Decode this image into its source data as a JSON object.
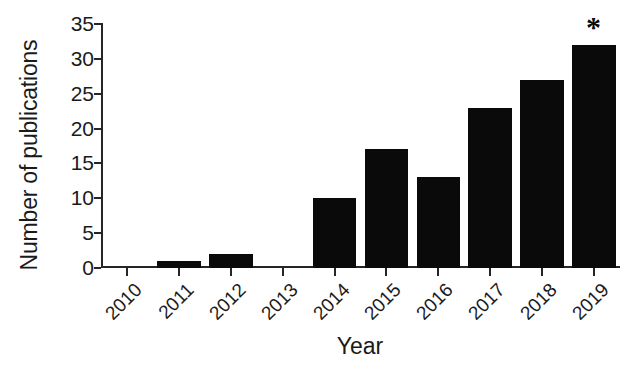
{
  "chart_data": {
    "type": "bar",
    "title": "",
    "xlabel": "Year",
    "ylabel": "Number of publications",
    "categories": [
      "2010",
      "2011",
      "2012",
      "2013",
      "2014",
      "2015",
      "2016",
      "2017",
      "2018",
      "2019"
    ],
    "values": [
      0,
      1,
      2,
      0,
      10,
      17,
      13,
      23,
      27,
      32
    ],
    "ylim": [
      0,
      35
    ],
    "yticks": [
      "0",
      "5",
      "10",
      "15",
      "20",
      "25",
      "30",
      "35"
    ],
    "ytick_values": [
      0,
      5,
      10,
      15,
      20,
      25,
      30,
      35
    ],
    "grid": false,
    "legend": null,
    "bar_color": "#0a0a0a",
    "axis_color": "#262626",
    "background": "#ffffff",
    "annotations": [
      {
        "text": "*",
        "category": "2019",
        "value": 32,
        "note": "asterisk above 2019 bar"
      }
    ]
  }
}
